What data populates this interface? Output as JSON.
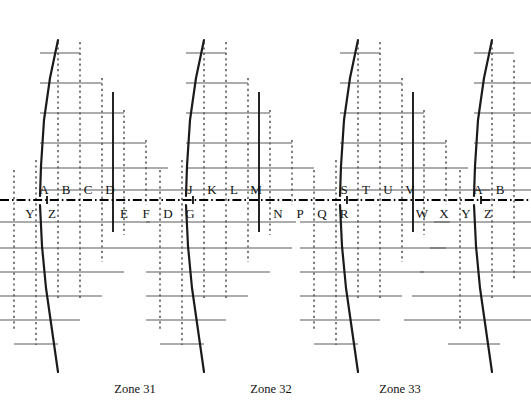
{
  "figure": {
    "background": "#ffffff",
    "axis_color": "#000000",
    "grid_color": "#3a3a3a",
    "line_color": "#1a1a1a",
    "axis_y": 200,
    "width": 531,
    "height": 417
  },
  "chart_data": {
    "type": "diagram",
    "title": "",
    "xlabel": "",
    "ylabel": "",
    "grid": true,
    "axis_style": "dash-dot",
    "axis_y": 200,
    "zones": [
      {
        "name": "Zone 31",
        "x": 135,
        "y": 389
      },
      {
        "name": "Zone 32",
        "x": 271,
        "y": 389
      },
      {
        "name": "Zone 33",
        "x": 400,
        "y": 389
      }
    ],
    "labels_above": [
      {
        "text": "A",
        "x": 44
      },
      {
        "text": "B",
        "x": 66
      },
      {
        "text": "C",
        "x": 88
      },
      {
        "text": "D",
        "x": 110
      },
      {
        "text": "J",
        "x": 190
      },
      {
        "text": "K",
        "x": 212
      },
      {
        "text": "L",
        "x": 234
      },
      {
        "text": "M",
        "x": 256
      },
      {
        "text": "S",
        "x": 344
      },
      {
        "text": "T",
        "x": 366
      },
      {
        "text": "U",
        "x": 388
      },
      {
        "text": "V",
        "x": 410
      },
      {
        "text": "A",
        "x": 478
      },
      {
        "text": "B",
        "x": 500
      }
    ],
    "labels_below": [
      {
        "text": "Y",
        "x": 30
      },
      {
        "text": "Z",
        "x": 52
      },
      {
        "text": "E",
        "x": 124
      },
      {
        "text": "F",
        "x": 146
      },
      {
        "text": "D",
        "x": 168
      },
      {
        "text": "G",
        "x": 190
      },
      {
        "text": "N",
        "x": 278
      },
      {
        "text": "P",
        "x": 300
      },
      {
        "text": "Q",
        "x": 322
      },
      {
        "text": "R",
        "x": 344
      },
      {
        "text": "W",
        "x": 422
      },
      {
        "text": "X",
        "x": 444
      },
      {
        "text": "Y",
        "x": 466
      },
      {
        "text": "Z",
        "x": 488
      }
    ],
    "label_y_above": 189,
    "label_y_below": 213,
    "dotted_verticals": [
      {
        "x": 14,
        "y1": 170,
        "y2": 330
      },
      {
        "x": 36,
        "y1": 160,
        "y2": 345
      },
      {
        "x": 58,
        "y1": 42,
        "y2": 300
      },
      {
        "x": 80,
        "y1": 42,
        "y2": 300
      },
      {
        "x": 102,
        "y1": 78,
        "y2": 262
      },
      {
        "x": 124,
        "y1": 110,
        "y2": 235
      },
      {
        "x": 146,
        "y1": 140,
        "y2": 205
      },
      {
        "x": 160,
        "y1": 170,
        "y2": 330
      },
      {
        "x": 182,
        "y1": 160,
        "y2": 345
      },
      {
        "x": 204,
        "y1": 42,
        "y2": 300
      },
      {
        "x": 226,
        "y1": 42,
        "y2": 300
      },
      {
        "x": 248,
        "y1": 78,
        "y2": 262
      },
      {
        "x": 270,
        "y1": 110,
        "y2": 235
      },
      {
        "x": 292,
        "y1": 140,
        "y2": 205
      },
      {
        "x": 314,
        "y1": 170,
        "y2": 330
      },
      {
        "x": 336,
        "y1": 160,
        "y2": 345
      },
      {
        "x": 358,
        "y1": 42,
        "y2": 300
      },
      {
        "x": 380,
        "y1": 42,
        "y2": 300
      },
      {
        "x": 402,
        "y1": 78,
        "y2": 262
      },
      {
        "x": 424,
        "y1": 110,
        "y2": 235
      },
      {
        "x": 446,
        "y1": 140,
        "y2": 205
      },
      {
        "x": 460,
        "y1": 170,
        "y2": 330
      },
      {
        "x": 492,
        "y1": 42,
        "y2": 300
      },
      {
        "x": 514,
        "y1": 60,
        "y2": 280
      }
    ],
    "solid_verticals": [
      {
        "x": 113,
        "y1": 92,
        "y2": 232
      },
      {
        "x": 259,
        "y1": 92,
        "y2": 232
      },
      {
        "x": 413,
        "y1": 92,
        "y2": 232
      },
      {
        "x": 47,
        "y1": 196,
        "y2": 204
      },
      {
        "x": 193,
        "y1": 196,
        "y2": 204
      },
      {
        "x": 347,
        "y1": 196,
        "y2": 204
      },
      {
        "x": 481,
        "y1": 196,
        "y2": 204
      }
    ],
    "stair_above": [
      {
        "x1": 40,
        "x2": 80,
        "y": 53
      },
      {
        "x1": 40,
        "x2": 102,
        "y": 83
      },
      {
        "x1": 40,
        "x2": 124,
        "y": 113
      },
      {
        "x1": 40,
        "x2": 146,
        "y": 143
      },
      {
        "x1": 40,
        "x2": 168,
        "y": 168
      },
      {
        "x1": 40,
        "x2": 190,
        "y": 190
      },
      {
        "x1": 186,
        "x2": 226,
        "y": 53
      },
      {
        "x1": 186,
        "x2": 248,
        "y": 83
      },
      {
        "x1": 186,
        "x2": 270,
        "y": 113
      },
      {
        "x1": 186,
        "x2": 292,
        "y": 143
      },
      {
        "x1": 186,
        "x2": 314,
        "y": 168
      },
      {
        "x1": 186,
        "x2": 336,
        "y": 190
      },
      {
        "x1": 340,
        "x2": 380,
        "y": 53
      },
      {
        "x1": 340,
        "x2": 402,
        "y": 83
      },
      {
        "x1": 340,
        "x2": 424,
        "y": 113
      },
      {
        "x1": 340,
        "x2": 446,
        "y": 143
      },
      {
        "x1": 340,
        "x2": 468,
        "y": 168
      },
      {
        "x1": 340,
        "x2": 490,
        "y": 190
      },
      {
        "x1": 474,
        "x2": 514,
        "y": 53
      },
      {
        "x1": 474,
        "x2": 531,
        "y": 83
      },
      {
        "x1": 474,
        "x2": 531,
        "y": 113
      },
      {
        "x1": 474,
        "x2": 531,
        "y": 143
      },
      {
        "x1": 474,
        "x2": 531,
        "y": 168
      },
      {
        "x1": 474,
        "x2": 531,
        "y": 190
      }
    ],
    "stair_below": [
      {
        "x1": 0,
        "x2": 150,
        "y": 222
      },
      {
        "x1": 0,
        "x2": 146,
        "y": 248
      },
      {
        "x1": 0,
        "x2": 124,
        "y": 272
      },
      {
        "x1": 0,
        "x2": 102,
        "y": 296
      },
      {
        "x1": 0,
        "x2": 80,
        "y": 320
      },
      {
        "x1": 14,
        "x2": 58,
        "y": 344
      },
      {
        "x1": 146,
        "x2": 296,
        "y": 222
      },
      {
        "x1": 146,
        "x2": 292,
        "y": 248
      },
      {
        "x1": 146,
        "x2": 270,
        "y": 272
      },
      {
        "x1": 146,
        "x2": 248,
        "y": 296
      },
      {
        "x1": 146,
        "x2": 226,
        "y": 320
      },
      {
        "x1": 160,
        "x2": 204,
        "y": 344
      },
      {
        "x1": 300,
        "x2": 450,
        "y": 222
      },
      {
        "x1": 300,
        "x2": 446,
        "y": 248
      },
      {
        "x1": 300,
        "x2": 424,
        "y": 272
      },
      {
        "x1": 300,
        "x2": 402,
        "y": 296
      },
      {
        "x1": 300,
        "x2": 380,
        "y": 320
      },
      {
        "x1": 314,
        "x2": 358,
        "y": 344
      },
      {
        "x1": 434,
        "x2": 531,
        "y": 222
      },
      {
        "x1": 430,
        "x2": 531,
        "y": 248
      },
      {
        "x1": 420,
        "x2": 531,
        "y": 272
      },
      {
        "x1": 412,
        "x2": 531,
        "y": 296
      },
      {
        "x1": 404,
        "x2": 531,
        "y": 320
      },
      {
        "x1": 448,
        "x2": 500,
        "y": 344
      }
    ],
    "curves_above": [
      {
        "points": "58,40 50,78 44,120 41,166 40,196"
      },
      {
        "points": "204,40 196,78 190,120 187,166 186,196"
      },
      {
        "points": "358,40 350,78 344,120 341,166 340,196"
      },
      {
        "points": "492,40 484,78 478,120 475,166 474,196"
      }
    ],
    "curves_below": [
      {
        "points": "40,205 42,246 46,288 52,330 58,372"
      },
      {
        "points": "186,205 188,246 192,288 198,330 204,372"
      },
      {
        "points": "340,205 342,246 346,288 352,330 358,372"
      },
      {
        "points": "474,205 476,246 480,288 486,330 492,372"
      }
    ],
    "tick_marks_above": [
      {
        "x": 58,
        "y": 40
      },
      {
        "x": 204,
        "y": 40
      },
      {
        "x": 358,
        "y": 40
      },
      {
        "x": 492,
        "y": 40
      }
    ]
  }
}
